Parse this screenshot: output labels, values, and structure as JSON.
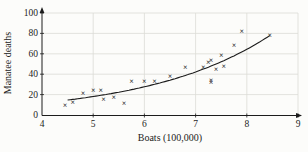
{
  "figure": {
    "background": "#fcfcfa",
    "grid_color": "#dcdcd6",
    "axis_color": "#1c1c1c",
    "label_color": "#1c1c1c",
    "marker_color": "#2a2a2a",
    "curve_color": "#1c1c1c",
    "marker_glyph": "×"
  },
  "chart_data": {
    "type": "scatter",
    "title": "",
    "xlabel": "Boats (100,000)",
    "ylabel": "Manatee deaths",
    "xlim": [
      4,
      9
    ],
    "ylim": [
      0,
      100
    ],
    "x_ticks": [
      4,
      5,
      6,
      7,
      8,
      9
    ],
    "y_ticks": [
      0,
      20,
      40,
      60,
      80,
      100
    ],
    "grid": true,
    "legend": "none",
    "points": [
      [
        4.45,
        10
      ],
      [
        4.6,
        13
      ],
      [
        4.8,
        21
      ],
      [
        5.0,
        24
      ],
      [
        5.15,
        24
      ],
      [
        5.2,
        16
      ],
      [
        5.4,
        18
      ],
      [
        5.6,
        12
      ],
      [
        5.75,
        33
      ],
      [
        6.0,
        33
      ],
      [
        6.2,
        33
      ],
      [
        6.5,
        38
      ],
      [
        6.8,
        47
      ],
      [
        7.15,
        47
      ],
      [
        7.25,
        52
      ],
      [
        7.3,
        54
      ],
      [
        7.3,
        34
      ],
      [
        7.3,
        32
      ],
      [
        7.4,
        45
      ],
      [
        7.55,
        48
      ],
      [
        7.5,
        59
      ],
      [
        7.75,
        69
      ],
      [
        7.9,
        82
      ],
      [
        8.45,
        78
      ]
    ],
    "curve": {
      "type": "exponential",
      "a": 2.19,
      "b": 1.526,
      "x_start": 4.5,
      "x_end": 8.45
    }
  }
}
